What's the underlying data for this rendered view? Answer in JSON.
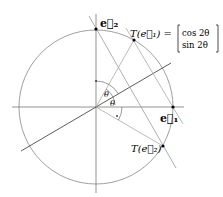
{
  "diagram": {
    "type": "reflection-across-line",
    "theta_degrees": 30,
    "colors": {
      "circle": "#888888",
      "axes": "#666666",
      "reflection_line": "#333333",
      "helper_lines": "#aaaaaa",
      "points": "#000000"
    },
    "labels": {
      "e2": "e⃗₂",
      "e1": "e⃗₁",
      "t_e1": "T(e⃗₁) =",
      "matrix_top": "cos 2θ",
      "matrix_bottom": "sin 2θ",
      "t_e2": "T(e⃗₂)",
      "theta_upper": "θ",
      "theta_lower": "θ"
    }
  }
}
